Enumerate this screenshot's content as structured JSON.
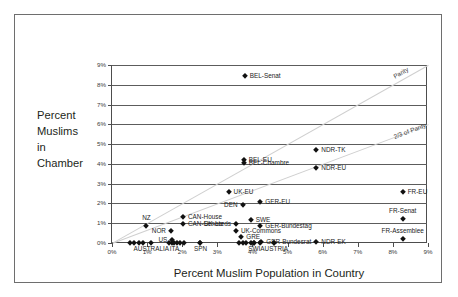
{
  "chart_data": {
    "type": "scatter",
    "title": "",
    "xlabel": "Percent Muslim Population in Country",
    "ylabel_lines": [
      "Percent",
      "Muslims",
      "in",
      "Chamber"
    ],
    "xlim": [
      0,
      9
    ],
    "ylim": [
      0,
      9
    ],
    "xticks": [
      "0%",
      "1%",
      "2%",
      "3%",
      "4%",
      "5%",
      "6%",
      "7%",
      "8%",
      "9%"
    ],
    "yticks": [
      "0%",
      "1%",
      "2%",
      "3%",
      "4%",
      "5%",
      "6%",
      "7%",
      "8%",
      "9%"
    ],
    "grid": "horizontal",
    "legend": "none",
    "reference_lines": [
      {
        "name": "parity",
        "label": "Parity",
        "slope": 1.0
      },
      {
        "name": "two-thirds-parity",
        "label": "2/3 of Parity",
        "slope": 0.6667
      }
    ],
    "points": [
      {
        "label": "BEL-Senat",
        "x": 3.78,
        "y": 8.45,
        "align": "rgt"
      },
      {
        "label": "NDR-TK",
        "x": 5.82,
        "y": 4.68,
        "align": "rgt"
      },
      {
        "label": "BEL-EU",
        "x": 3.75,
        "y": 4.2,
        "align": "rgt"
      },
      {
        "label": "BEL-Chambre",
        "x": 3.75,
        "y": 4.05,
        "align": "rgt"
      },
      {
        "label": "NDR-EU",
        "x": 5.82,
        "y": 3.78,
        "align": "rgt"
      },
      {
        "label": "FR-EU",
        "x": 8.28,
        "y": 2.58,
        "align": "rgt"
      },
      {
        "label": "UK-EU",
        "x": 3.32,
        "y": 2.57,
        "align": "rgt"
      },
      {
        "label": "GER-EU",
        "x": 4.22,
        "y": 2.05,
        "align": "rgt"
      },
      {
        "label": "DEN",
        "x": 3.72,
        "y": 1.92,
        "align": "lft"
      },
      {
        "label": "CAN-House",
        "x": 2.02,
        "y": 1.33,
        "align": "rgt"
      },
      {
        "label": "SWE",
        "x": 3.95,
        "y": 1.18,
        "align": "rgt"
      },
      {
        "label": "FR-Senat",
        "x": 8.28,
        "y": 1.23,
        "align": "ctr"
      },
      {
        "label": "UK-Lords",
        "x": 3.53,
        "y": 0.98,
        "align": "lft"
      },
      {
        "label": "CAN-Senate",
        "x": 2.02,
        "y": 0.95,
        "align": "rgt"
      },
      {
        "label": "NZ",
        "x": 0.98,
        "y": 0.85,
        "align": "ctr"
      },
      {
        "label": "GER-Bundestag",
        "x": 4.22,
        "y": 0.85,
        "align": "rgt"
      },
      {
        "label": "NOR",
        "x": 1.68,
        "y": 0.6,
        "align": "lft"
      },
      {
        "label": "UK-Commons",
        "x": 3.53,
        "y": 0.63,
        "align": "rgt"
      },
      {
        "label": "GRE",
        "x": 3.68,
        "y": 0.32,
        "align": "rgt"
      },
      {
        "label": "FR-Assemblee",
        "x": 8.28,
        "y": 0.18,
        "align": "ctr"
      },
      {
        "label": "US",
        "x": 1.72,
        "y": 0.16,
        "align": "lft"
      },
      {
        "label": "GER-Bundesrat",
        "x": 4.25,
        "y": 0.05,
        "align": "rgt"
      },
      {
        "label": "NDR-EK",
        "x": 5.82,
        "y": 0.05,
        "align": "rgt"
      },
      {
        "label": "AUSTRALIA",
        "x": 1.12,
        "y": 0.02,
        "align": "ctr"
      },
      {
        "label": "ITA",
        "x": 1.78,
        "y": 0.02,
        "align": "ctr"
      },
      {
        "label": "SPN",
        "x": 2.52,
        "y": 0.02,
        "align": "ctr"
      },
      {
        "label": "SWI",
        "x": 4.05,
        "y": 0.02,
        "align": "ctr"
      },
      {
        "label": "AUSTRIA",
        "x": 4.62,
        "y": 0.02,
        "align": "ctr"
      }
    ],
    "unlabeled_points": [
      {
        "x": 0.52,
        "y": 0.02
      },
      {
        "x": 0.62,
        "y": 0.02
      },
      {
        "x": 0.78,
        "y": 0.02
      },
      {
        "x": 0.88,
        "y": 0.02
      },
      {
        "x": 1.62,
        "y": 0.02
      },
      {
        "x": 1.72,
        "y": 0.02
      },
      {
        "x": 1.85,
        "y": 0.02
      },
      {
        "x": 1.95,
        "y": 0.02
      },
      {
        "x": 2.05,
        "y": 0.02
      },
      {
        "x": 2.52,
        "y": 0.02
      },
      {
        "x": 3.62,
        "y": 0.02
      },
      {
        "x": 3.72,
        "y": 0.02
      },
      {
        "x": 3.82,
        "y": 0.02
      },
      {
        "x": 3.95,
        "y": 0.02
      },
      {
        "x": 4.05,
        "y": 0.02
      },
      {
        "x": 4.22,
        "y": 0.02
      },
      {
        "x": 4.62,
        "y": 0.02
      }
    ]
  }
}
